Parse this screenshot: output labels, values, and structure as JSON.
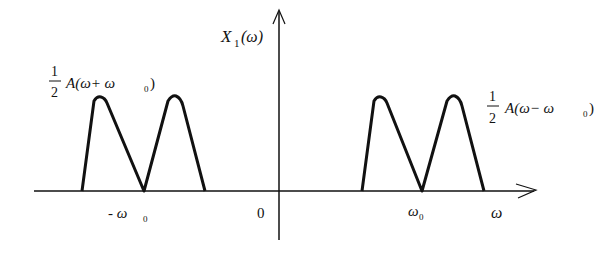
{
  "diagram": {
    "y_axis_label": "X",
    "y_axis_subscript": "1",
    "y_axis_arg": "(ω)",
    "x_axis_label": "ω",
    "origin_label": "0",
    "tick_neg": "- ω",
    "tick_neg_sub": "0",
    "tick_pos": "ω",
    "tick_pos_sub": "0",
    "left_curve": {
      "frac_num": "1",
      "frac_den": "2",
      "expr": "A(ω+ ω",
      "expr_sub": "0",
      "expr_close": ")"
    },
    "right_curve": {
      "frac_num": "1",
      "frac_den": "2",
      "expr": "A(ω− ω",
      "expr_sub": "0",
      "expr_close": ")"
    },
    "colors": {
      "stroke": "#111111",
      "background": "#ffffff"
    }
  }
}
